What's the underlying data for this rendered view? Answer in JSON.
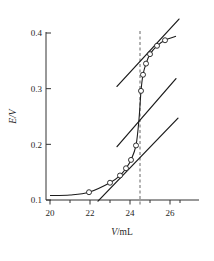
{
  "chart_data": {
    "type": "line",
    "title": "",
    "xlabel": "V/mL",
    "ylabel": "E/V",
    "xlim": [
      19.6,
      26.6
    ],
    "ylim": [
      0.093,
      0.425
    ],
    "grid": false,
    "legend": null,
    "xticks": [
      20,
      22,
      24,
      26
    ],
    "xtick_labels": [
      "20",
      "22",
      "24",
      "26"
    ],
    "xminor_ticks": [
      21,
      23,
      25,
      26
    ],
    "yticks": [
      0.1,
      0.2,
      0.3,
      0.4
    ],
    "ytick_labels": [
      "0.1",
      "0.2",
      "0.3",
      "0.4"
    ],
    "series": [
      {
        "name": "titration curve",
        "type": "line",
        "marker": "open-circle",
        "x": [
          20.0,
          21.0,
          21.95,
          23.0,
          23.5,
          23.8,
          24.05,
          24.3,
          24.45,
          24.55,
          24.65,
          24.8,
          25.0,
          25.35,
          25.75,
          26.3
        ],
        "y": [
          0.108,
          0.109,
          0.114,
          0.131,
          0.144,
          0.157,
          0.172,
          0.198,
          0.245,
          0.296,
          0.325,
          0.345,
          0.362,
          0.377,
          0.387,
          0.394
        ]
      },
      {
        "name": "data points",
        "type": "scatter",
        "marker": "open-circle",
        "x": [
          21.95,
          23.0,
          23.5,
          23.8,
          24.05,
          24.3,
          24.55,
          24.65,
          24.8,
          25.0,
          25.35,
          25.75
        ],
        "y": [
          0.114,
          0.131,
          0.144,
          0.157,
          0.172,
          0.198,
          0.296,
          0.325,
          0.345,
          0.362,
          0.377,
          0.387
        ]
      },
      {
        "name": "tangent line upper",
        "type": "line",
        "x": [
          23.35,
          26.45
        ],
        "y": [
          0.304,
          0.425
        ]
      },
      {
        "name": "tangent line middle",
        "type": "line",
        "x": [
          23.35,
          26.3
        ],
        "y": [
          0.196,
          0.318
        ]
      },
      {
        "name": "tangent line lower",
        "type": "line",
        "x": [
          22.4,
          26.4
        ],
        "y": [
          0.098,
          0.247
        ]
      },
      {
        "name": "equivalence point marker",
        "type": "vline",
        "style": "dashed",
        "x": 24.5
      }
    ]
  }
}
